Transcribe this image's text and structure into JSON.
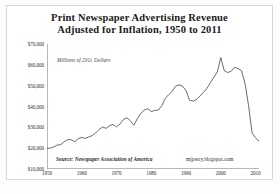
{
  "figure": {
    "title_line_1": "Print Newspaper Advertising Revenue",
    "title_line_2": "Adjusted for Inflation, 1950 to 2011",
    "subtitle": "Millions of 2011 Dollars",
    "source": "Source: Newspaper Association of America",
    "credit": "mjperry.blogspot.com",
    "background_color": "#ffffff",
    "frame_color": "#d8d8d8",
    "line_color": "#5a5a5a",
    "text_color": "#1b1b1b"
  },
  "chart_data": {
    "type": "line",
    "title": "Print Newspaper Advertising Revenue Adjusted for Inflation, 1950 to 2011",
    "subtitle": "Millions of 2011 Dollars",
    "xlabel": "",
    "ylabel": "",
    "grid": false,
    "legend": "none",
    "xlim": [
      1950,
      2011
    ],
    "ylim": [
      10000,
      70000
    ],
    "ytick_labels": [
      "$70,000",
      "$60,000",
      "$50,000",
      "$40,000",
      "$30,000",
      "$20,000",
      "$10,000"
    ],
    "ytick_values": [
      70000,
      60000,
      50000,
      40000,
      30000,
      20000,
      10000
    ],
    "xtick_labels": [
      "1950",
      "1960",
      "1970",
      "1980",
      "1990",
      "2000",
      "2010"
    ],
    "xtick_values": [
      1950,
      1960,
      1970,
      1980,
      1990,
      2000,
      2010
    ],
    "series": [
      {
        "name": "Print Newspaper Advertising Revenue",
        "x": [
          1950,
          1951,
          1952,
          1953,
          1954,
          1955,
          1956,
          1957,
          1958,
          1959,
          1960,
          1961,
          1962,
          1963,
          1964,
          1965,
          1966,
          1967,
          1968,
          1969,
          1970,
          1971,
          1972,
          1973,
          1974,
          1975,
          1976,
          1977,
          1978,
          1979,
          1980,
          1981,
          1982,
          1983,
          1984,
          1985,
          1986,
          1987,
          1988,
          1989,
          1990,
          1991,
          1992,
          1993,
          1994,
          1995,
          1996,
          1997,
          1998,
          1999,
          2000,
          2001,
          2002,
          2003,
          2004,
          2005,
          2006,
          2007,
          2008,
          2009,
          2010,
          2011
        ],
        "values": [
          19800,
          20100,
          20600,
          21500,
          21700,
          23200,
          24100,
          24000,
          23100,
          24600,
          25200,
          24700,
          25400,
          26000,
          27300,
          29000,
          30200,
          29500,
          30800,
          31400,
          30200,
          31600,
          33800,
          34600,
          33100,
          31000,
          34200,
          36700,
          38300,
          38900,
          37600,
          38100,
          38300,
          40300,
          43800,
          45700,
          47200,
          49800,
          50400,
          49800,
          47600,
          43000,
          42600,
          43300,
          45100,
          46700,
          48700,
          51400,
          54000,
          56600,
          63500,
          57200,
          56300,
          56900,
          58800,
          58200,
          57100,
          50900,
          40400,
          27400,
          24900,
          23400
        ],
        "color": "#5a5a5a"
      }
    ]
  }
}
